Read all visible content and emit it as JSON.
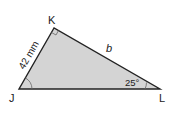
{
  "diagram": {
    "type": "right-triangle",
    "vertices": {
      "K": {
        "label": "K",
        "x": 54,
        "y": 28
      },
      "J": {
        "label": "J",
        "x": 19,
        "y": 89
      },
      "L": {
        "label": "L",
        "x": 160,
        "y": 89
      }
    },
    "sides": {
      "JK": {
        "label": "42 mm"
      },
      "KL": {
        "label": "b"
      }
    },
    "angles": {
      "L": {
        "label": "25°"
      },
      "K": {
        "right_angle": true
      },
      "J": {
        "arc": true
      }
    },
    "colors": {
      "fill": "#d4d4d4",
      "stroke": "#222222"
    }
  }
}
